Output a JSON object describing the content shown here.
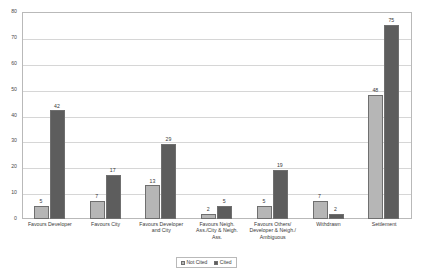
{
  "chart_data": {
    "type": "bar",
    "title": "",
    "subtitle": "",
    "xlabel": "",
    "ylabel": "",
    "ylim": [
      0,
      80
    ],
    "y_ticks": [
      0,
      10,
      20,
      30,
      40,
      50,
      60,
      70,
      80
    ],
    "grid": true,
    "legend_position": "bottom-right",
    "categories": [
      "Favours Developer",
      "Favours City",
      "Favours Developer and City",
      "Favours Neigh. Ass./City & Neigh. Ass.",
      "Favours Others/ Developer & Neigh./ Ambiguous",
      "Withdrawn",
      "Settlement"
    ],
    "category_lines": [
      [
        "Favours Developer"
      ],
      [
        "Favours City"
      ],
      [
        "Favours Developer",
        "and City"
      ],
      [
        "Favours Neigh.",
        "Ass./City & Neigh.",
        "Ass."
      ],
      [
        "Favours Others/",
        "Developer & Neigh./",
        "Ambiguous"
      ],
      [
        "Withdrawn"
      ],
      [
        "Settlement"
      ]
    ],
    "series": [
      {
        "name": "Not Cited",
        "color": "#b6b6b6",
        "values": [
          5,
          7,
          13,
          2,
          5,
          7,
          48
        ]
      },
      {
        "name": "Cited",
        "color": "#5d5d5d",
        "values": [
          42,
          17,
          29,
          5,
          19,
          2,
          75
        ]
      }
    ]
  },
  "legend": {
    "items": [
      {
        "label": "Not Cited"
      },
      {
        "label": "Cited"
      }
    ]
  }
}
